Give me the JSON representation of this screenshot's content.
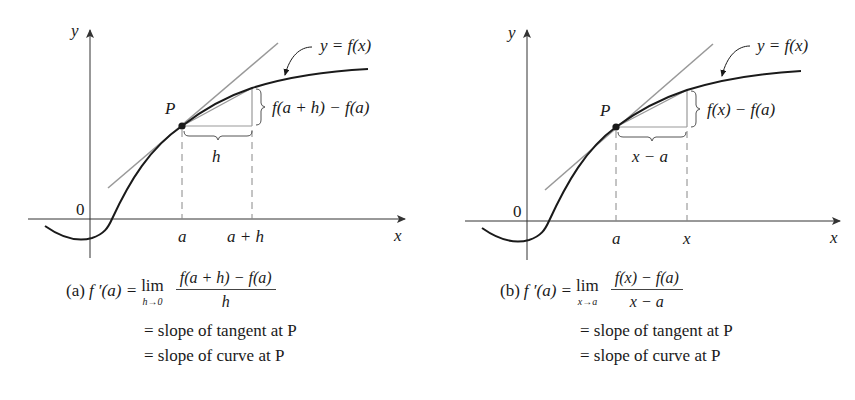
{
  "figure_a": {
    "y_axis_label": "y",
    "x_axis_label": "x",
    "origin_label": "0",
    "curve_label": "y = f(x)",
    "point_label": "P",
    "rise_label": "f(a + h) − f(a)",
    "run_label": "h",
    "tick_a": "a",
    "tick_b": "a + h",
    "caption": {
      "tag": "(a)",
      "lhs": "f ′(a) =",
      "lim": "lim",
      "lim_sub": "h→0",
      "numerator": "f(a + h) − f(a)",
      "denominator": "h",
      "line2": "= slope of tangent at P",
      "line3": "= slope of curve at P"
    }
  },
  "figure_b": {
    "y_axis_label": "y",
    "x_axis_label": "x",
    "origin_label": "0",
    "curve_label": "y = f(x)",
    "point_label": "P",
    "rise_label": "f(x) − f(a)",
    "run_label": "x − a",
    "tick_a": "a",
    "tick_b": "x",
    "caption": {
      "tag": "(b)",
      "lhs": "f ′(a) =",
      "lim": "lim",
      "lim_sub": "x→a",
      "numerator": "f(x) − f(a)",
      "denominator": "x − a",
      "line2": "= slope of tangent at P",
      "line3": "= slope of curve at P"
    }
  },
  "colors": {
    "curve": "#1a1a1a",
    "tangent": "#999999",
    "guides": "#888888",
    "axes": "#333333"
  }
}
